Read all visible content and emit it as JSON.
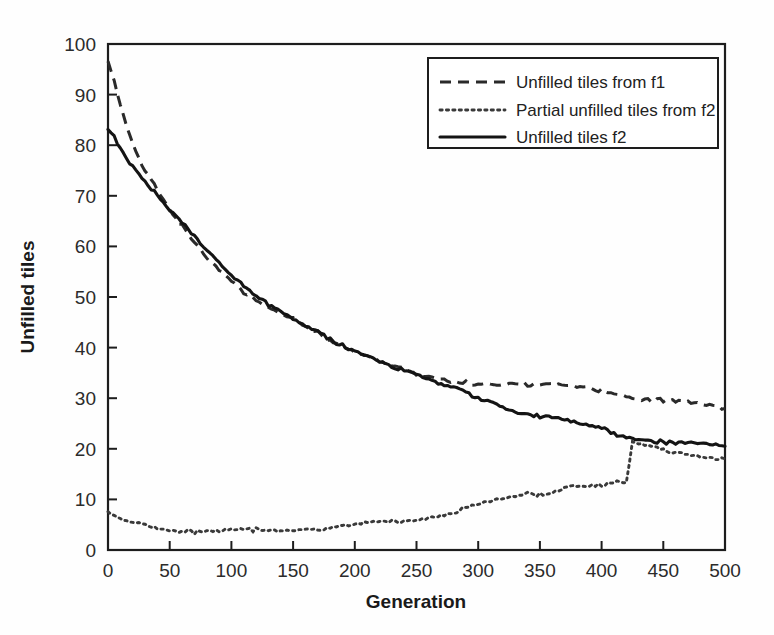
{
  "chart_data": {
    "type": "line",
    "title": "",
    "xlabel": "Generation",
    "ylabel": "Unfilled tiles",
    "xlim": [
      0,
      500
    ],
    "ylim": [
      0,
      100
    ],
    "xticks": [
      0,
      50,
      100,
      150,
      200,
      250,
      300,
      350,
      400,
      450,
      500
    ],
    "yticks": [
      0,
      10,
      20,
      30,
      40,
      50,
      60,
      70,
      80,
      90,
      100
    ],
    "grid": false,
    "legend_position": "top-right",
    "x": [
      0,
      5,
      10,
      15,
      20,
      25,
      30,
      35,
      40,
      45,
      50,
      60,
      70,
      80,
      90,
      100,
      110,
      120,
      130,
      140,
      150,
      160,
      170,
      180,
      190,
      200,
      210,
      220,
      230,
      240,
      250,
      260,
      270,
      280,
      290,
      300,
      310,
      320,
      330,
      340,
      350,
      360,
      370,
      380,
      390,
      400,
      410,
      420,
      425,
      430,
      440,
      450,
      460,
      470,
      480,
      490,
      500
    ],
    "series": [
      {
        "name": "Unfilled tiles from f1",
        "style": "dashed",
        "color": "#2a2a2a",
        "values": [
          96.5,
          93.0,
          88.0,
          84.0,
          80.5,
          77.5,
          75.0,
          73.0,
          71.0,
          69.0,
          67.0,
          64.0,
          61.0,
          58.0,
          55.5,
          53.5,
          51.0,
          49.5,
          47.5,
          46.5,
          45.5,
          44.0,
          43.0,
          41.5,
          40.5,
          39.5,
          38.5,
          37.5,
          36.5,
          35.5,
          34.5,
          34.0,
          33.5,
          33.2,
          33.0,
          33.0,
          33.0,
          33.0,
          33.0,
          32.8,
          32.5,
          32.5,
          32.3,
          32.0,
          31.8,
          31.5,
          31.0,
          30.5,
          30.3,
          30.0,
          29.7,
          29.5,
          29.2,
          29.0,
          28.7,
          28.4,
          28.0
        ]
      },
      {
        "name": "Partial unfilled tiles from f2",
        "style": "dotted",
        "color": "#3a3a3a",
        "values": [
          8.0,
          7.0,
          6.0,
          5.5,
          5.2,
          5.0,
          5.0,
          4.8,
          4.5,
          4.2,
          4.0,
          3.8,
          3.5,
          3.5,
          3.6,
          3.8,
          4.0,
          4.0,
          4.0,
          4.0,
          4.2,
          4.2,
          4.2,
          4.3,
          4.5,
          5.0,
          5.2,
          5.5,
          5.5,
          5.8,
          6.0,
          6.5,
          7.0,
          7.5,
          8.5,
          8.8,
          9.5,
          10.0,
          10.5,
          11.0,
          11.0,
          11.5,
          12.5,
          13.0,
          13.0,
          13.0,
          13.2,
          13.3,
          21.0,
          20.8,
          20.2,
          19.8,
          19.5,
          19.0,
          18.7,
          18.4,
          18.0
        ]
      },
      {
        "name": "Unfilled tiles f2",
        "style": "solid",
        "color": "#141414",
        "values": [
          83.0,
          81.5,
          79.5,
          77.5,
          76.0,
          74.5,
          73.0,
          71.5,
          70.0,
          68.5,
          67.0,
          64.5,
          62.0,
          59.5,
          57.0,
          54.5,
          52.5,
          50.5,
          48.5,
          47.0,
          45.5,
          44.0,
          43.0,
          41.5,
          40.5,
          39.5,
          38.5,
          37.5,
          36.5,
          35.5,
          34.5,
          33.5,
          32.5,
          32.0,
          31.0,
          30.0,
          29.5,
          28.5,
          27.5,
          27.0,
          26.5,
          26.0,
          25.5,
          25.0,
          24.5,
          24.0,
          23.0,
          22.5,
          22.3,
          22.0,
          21.7,
          21.4,
          21.2,
          21.0,
          20.8,
          20.6,
          20.5
        ]
      }
    ]
  },
  "legend": {
    "entries": [
      {
        "label": "Unfilled tiles from f1"
      },
      {
        "label": "Partial unfilled tiles from f2"
      },
      {
        "label": "Unfilled tiles f2"
      }
    ]
  }
}
